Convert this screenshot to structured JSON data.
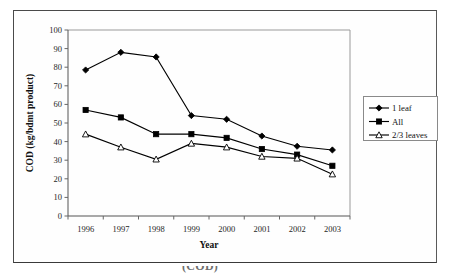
{
  "figure": {
    "frame_color": "#4a4a4a",
    "background": "#ffffff",
    "caption_fragment": "(COD)"
  },
  "chart_data": {
    "type": "line",
    "title": "",
    "xlabel": "Year",
    "ylabel": "COD (kg/bdmt product)",
    "categories": [
      "1996",
      "1997",
      "1998",
      "1999",
      "2000",
      "2001",
      "2002",
      "2003"
    ],
    "x": [
      1996,
      1997,
      1998,
      1999,
      2000,
      2001,
      2002,
      2003
    ],
    "ylim": [
      0,
      100
    ],
    "yticks": [
      "0",
      "10",
      "20",
      "30",
      "40",
      "50",
      "60",
      "70",
      "80",
      "90",
      "100"
    ],
    "ytick_values": [
      0,
      10,
      20,
      30,
      40,
      50,
      60,
      70,
      80,
      90,
      100
    ],
    "grid": false,
    "legend_position": "right-outside",
    "series": [
      {
        "name": "1 leaf",
        "marker": "filled-diamond",
        "color": "#000000",
        "values": [
          78.5,
          88.0,
          85.5,
          54.0,
          52.0,
          43.0,
          37.5,
          35.5
        ]
      },
      {
        "name": "All",
        "marker": "filled-square",
        "color": "#000000",
        "values": [
          57.0,
          53.0,
          44.0,
          44.0,
          42.0,
          36.0,
          33.0,
          27.0
        ]
      },
      {
        "name": "2/3 leaves",
        "marker": "open-triangle",
        "color": "#000000",
        "values": [
          44.0,
          37.0,
          30.5,
          39.0,
          37.0,
          32.0,
          31.0,
          22.5
        ]
      }
    ]
  },
  "legend": {
    "entries": [
      {
        "label": "1 leaf",
        "marker": "filled-diamond"
      },
      {
        "label": "All",
        "marker": "filled-square"
      },
      {
        "label": "2/3 leaves",
        "marker": "open-triangle"
      }
    ]
  }
}
